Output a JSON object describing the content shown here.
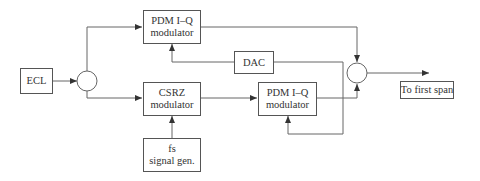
{
  "diagram": {
    "type": "block-diagram",
    "nodes": {
      "ecl": {
        "lines": [
          "ECL"
        ]
      },
      "pdm_top": {
        "lines": [
          "PDM I–Q",
          "modulator"
        ]
      },
      "csrz": {
        "lines": [
          "CSRZ",
          "modulator"
        ]
      },
      "dac": {
        "lines": [
          "DAC"
        ]
      },
      "pdm_bottom": {
        "lines": [
          "PDM I–Q",
          "modulator"
        ]
      },
      "signal_gen": {
        "lines": [
          "fs",
          "signal gen."
        ]
      },
      "output": {
        "lines": [
          "To first span"
        ]
      }
    },
    "splitter": "optical splitter",
    "combiner": "optical combiner",
    "edges": [
      {
        "from": "ECL",
        "to": "splitter"
      },
      {
        "from": "splitter",
        "to": "PDM I–Q modulator (top)"
      },
      {
        "from": "splitter",
        "to": "CSRZ modulator"
      },
      {
        "from": "fs signal gen.",
        "to": "CSRZ modulator"
      },
      {
        "from": "CSRZ modulator",
        "to": "PDM I–Q modulator (bottom)"
      },
      {
        "from": "DAC",
        "to": "PDM I–Q modulator (top)"
      },
      {
        "from": "DAC",
        "to": "PDM I–Q modulator (bottom)"
      },
      {
        "from": "PDM I–Q modulator (top)",
        "to": "combiner"
      },
      {
        "from": "PDM I–Q modulator (bottom)",
        "to": "combiner"
      },
      {
        "from": "combiner",
        "to": "To first span"
      }
    ],
    "colors": {
      "line": "#555555",
      "text": "#333333",
      "background": "#ffffff"
    }
  }
}
